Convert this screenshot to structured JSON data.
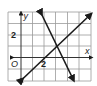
{
  "figure": {
    "type": "coordinate-graph",
    "x_axis_label": "x",
    "y_axis_label": "y",
    "origin_label": "O",
    "x_tick_label": "2",
    "y_tick_label": "2",
    "grid": {
      "x_min": -1,
      "x_max": 6,
      "y_min": -2,
      "y_max": 4,
      "unit_px": 11.6
    },
    "lines": [
      {
        "name": "line-positive-slope",
        "through": [
          [
            0,
            -2
          ],
          [
            5,
            3.6
          ]
        ],
        "color": "#1a1a1a"
      },
      {
        "name": "line-negative-slope",
        "through": [
          [
            1.7,
            4
          ],
          [
            4.5,
            -1.8
          ]
        ],
        "color": "#1a1a1a"
      }
    ],
    "intersection_approx": [
      3.2,
      1
    ]
  }
}
